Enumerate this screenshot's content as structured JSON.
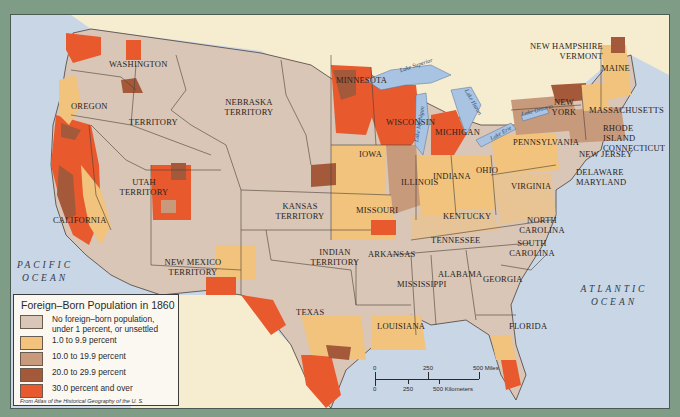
{
  "map": {
    "title": "Foreign-Born Population in 1860",
    "colors": {
      "ocean": "#c9d6e6",
      "foreign_land": "#f6edd0",
      "frame_bg": "#7f9c87",
      "border": "#4b4038",
      "lake": "#a9c3e3"
    },
    "regions": {
      "washington": "WASHINGTON",
      "oregon": "OREGON",
      "territory": "TERRITORY",
      "nebraska": "NEBRASKA TERRITORY",
      "utah": "UTAH TERRITORY",
      "california": "CALIFORNIA",
      "kansas": "KANSAS TERRITORY",
      "new_mexico": "NEW MEXICO TERRITORY",
      "indian": "INDIAN TERRITORY",
      "texas": "TEXAS",
      "minnesota": "MINNESOTA",
      "wisconsin": "WISCONSIN",
      "iowa": "IOWA",
      "illinois": "ILLINOIS",
      "missouri": "MISSOURI",
      "michigan": "MICHIGAN",
      "indiana": "INDIANA",
      "ohio": "OHIO",
      "kentucky": "KENTUCKY",
      "tennessee": "TENNESSEE",
      "arkansas": "ARKANSAS",
      "mississippi": "MISSISSIPPI",
      "alabama": "ALABAMA",
      "georgia": "GEORGIA",
      "louisiana": "LOUISIANA",
      "florida": "FLORIDA",
      "south_carolina": "SOUTH CAROLINA",
      "north_carolina": "NORTH CAROLINA",
      "virginia": "VIRGINIA",
      "pennsylvania": "PENNSYLVANIA",
      "new_york": "NEW YORK",
      "new_jersey": "NEW JERSEY",
      "delaware_maryland": "DELAWARE MARYLAND",
      "massachusetts": "MASSACHUSETTS",
      "ri_ct": "RHODE ISLAND CONNECTICUT",
      "nh_vt": "NEW HAMPSHIRE VERMONT",
      "maine": "MAINE"
    },
    "oceans": {
      "pacific": "PACIFIC OCEAN",
      "atlantic": "ATLANTIC OCEAN"
    },
    "lakes": {
      "superior": "Lake Superior",
      "michigan": "Lake Michigan",
      "huron": "Lake Huron",
      "erie": "Lake Erie",
      "ontario": "Lake Ontario"
    }
  },
  "legend": {
    "title": "Foreign–Born Population in 1860",
    "items": [
      {
        "label": "No foreign–born population, under 1 percent, or unsettled",
        "line1": "No foreign–born population,",
        "line2": "under 1 percent, or unsettled",
        "color": "#d9c6b6"
      },
      {
        "label": "1.0 to 9.9 percent",
        "color": "#f1c37d"
      },
      {
        "label": "10.0 to 19.9 percent",
        "color": "#c89a7c"
      },
      {
        "label": "20.0 to 29.9 percent",
        "color": "#a45a3a"
      },
      {
        "label": "30.0 percent and over",
        "color": "#e9592e"
      }
    ],
    "source": "From Atlas of the Historical Geography of the U. S.",
    "source_line1": "From Atlas of the Historical Geography",
    "source_line2": "of the U. S."
  },
  "scale_bar": {
    "miles": {
      "zero": "0",
      "mid": "250",
      "max": "500 Miles"
    },
    "km": {
      "zero": "0",
      "mid": "250",
      "max": "500 Kilometers"
    }
  }
}
